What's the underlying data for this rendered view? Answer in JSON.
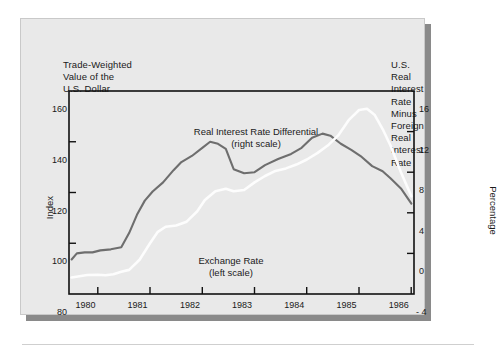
{
  "titles": {
    "left": "Trade-Weighted\nValue of the\nU.S. Dollar",
    "right": "U.S. Real Interest\nRate Minus Foreign\nReal Interest Rate"
  },
  "axes": {
    "left_name": "Index",
    "right_name": "Percentage",
    "left_ticks": [
      "160",
      "140",
      "120",
      "100",
      "80"
    ],
    "right_ticks": [
      "16",
      "12",
      "8",
      "4",
      "0",
      "- 4"
    ],
    "x_ticks": [
      "1980",
      "1981",
      "1982",
      "1983",
      "1984",
      "1985",
      "1986"
    ]
  },
  "series_labels": {
    "rird": "Real Interest Rate Differential\n(right scale)",
    "exchange": "Exchange Rate\n(left scale)"
  },
  "colors": {
    "panel": "#e9e9e9",
    "frame": "#111111",
    "rird_line": "#6e6e6e",
    "exchange_line": "#fdfdfd",
    "text": "#1a1a1a"
  },
  "chart_data": {
    "type": "line",
    "xlabel": "",
    "ylabel": "Index",
    "y2label": "Percentage",
    "xlim": [
      1979.45,
      1986.05
    ],
    "ylim": [
      80,
      160
    ],
    "y2lim": [
      -4,
      16
    ],
    "grid": false,
    "legend": "in-plot annotations",
    "xticks": [
      1980,
      1981,
      1982,
      1983,
      1984,
      1985,
      1986
    ],
    "yticks": [
      80,
      100,
      120,
      140,
      160
    ],
    "y2ticks": [
      -4,
      0,
      4,
      8,
      12,
      16
    ],
    "series": [
      {
        "name": "Exchange Rate (left scale)",
        "axis": "left",
        "units": "Index",
        "color": "#fdfdfd",
        "x": [
          1979.5,
          1979.65,
          1979.8,
          1980.0,
          1980.15,
          1980.3,
          1980.45,
          1980.6,
          1980.8,
          1981.0,
          1981.15,
          1981.3,
          1981.5,
          1981.7,
          1981.9,
          1982.05,
          1982.25,
          1982.45,
          1982.6,
          1982.8,
          1983.0,
          1983.2,
          1983.4,
          1983.6,
          1983.8,
          1984.0,
          1984.2,
          1984.4,
          1984.6,
          1984.8,
          1985.0,
          1985.15,
          1985.3,
          1985.45,
          1985.6,
          1985.8,
          1986.0
        ],
        "y": [
          86.5,
          87.0,
          87.5,
          87.6,
          87.4,
          87.8,
          88.8,
          89.5,
          93.5,
          100.0,
          104.5,
          106.5,
          107.0,
          108.5,
          112.5,
          117.0,
          120.5,
          121.5,
          120.5,
          121.0,
          124.0,
          126.5,
          128.5,
          129.5,
          131.0,
          133.0,
          135.5,
          138.5,
          142.5,
          148.5,
          152.5,
          153.0,
          150.5,
          145.0,
          138.5,
          128.0,
          118.5
        ]
      },
      {
        "name": "Real Interest Rate Differential (right scale)",
        "axis": "right",
        "units": "Percentage",
        "color": "#6e6e6e",
        "x": [
          1979.5,
          1979.6,
          1979.75,
          1979.9,
          1980.05,
          1980.25,
          1980.45,
          1980.6,
          1980.75,
          1980.9,
          1981.05,
          1981.25,
          1981.45,
          1981.6,
          1981.8,
          1982.0,
          1982.15,
          1982.3,
          1982.45,
          1982.6,
          1982.8,
          1983.0,
          1983.2,
          1983.45,
          1983.7,
          1983.9,
          1984.1,
          1984.3,
          1984.45,
          1984.65,
          1984.85,
          1985.05,
          1985.25,
          1985.45,
          1985.6,
          1985.8,
          1986.0
        ],
        "y": [
          -0.6,
          0.0,
          0.1,
          0.1,
          0.3,
          0.4,
          0.6,
          2.0,
          3.8,
          5.2,
          6.1,
          7.0,
          8.2,
          9.0,
          9.6,
          10.4,
          11.0,
          10.8,
          10.3,
          8.3,
          7.9,
          8.0,
          8.7,
          9.3,
          9.8,
          10.4,
          11.4,
          11.8,
          11.6,
          10.8,
          10.2,
          9.5,
          8.6,
          8.1,
          7.4,
          6.4,
          4.9
        ]
      }
    ]
  }
}
